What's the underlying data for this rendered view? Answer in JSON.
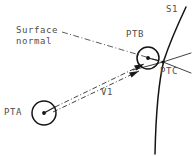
{
  "diagram": {
    "type": "technical-line-diagram",
    "canvas": {
      "width": 192,
      "height": 157,
      "background": "#ffffff"
    },
    "colors": {
      "line": "#1a1a1a",
      "curve": "#141414",
      "dashdot": "#3a3a3a",
      "text": "#4d4d4d",
      "background": "#ffffff"
    },
    "labels": {
      "surface_normal": "Surface\nnormal",
      "pta": "PTA",
      "ptb": "PTB",
      "ptc": "PTC",
      "s1": "S1",
      "v1": "V1"
    },
    "points": [
      {
        "id": "PTA",
        "label": "PTA",
        "x": 44,
        "y": 113,
        "marker": "circle-with-center-dot",
        "radius": 12
      },
      {
        "id": "PTB",
        "label": "PTB",
        "x": 148,
        "y": 58,
        "marker": "circle-with-center-dot",
        "radius": 11
      },
      {
        "id": "PTC",
        "label": "PTC",
        "x": 163,
        "y": 62,
        "marker": "intersection",
        "radius": 0
      }
    ],
    "curves": [
      {
        "id": "S1",
        "label": "S1",
        "style": "solid",
        "description": "surface profile curve passing through PTC"
      }
    ],
    "vectors": [
      {
        "id": "V1",
        "label": "V1",
        "from": "PTA",
        "to": "PTB",
        "style": "dash-dot",
        "arrowheads": 2,
        "description": "incident direction vector drawn as a double parallel dash-dot arrow"
      },
      {
        "id": "N1",
        "label": "Surface normal",
        "to": "PTC",
        "style": "dash-dot",
        "description": "leader line from the Surface normal caption to point PTC"
      }
    ],
    "tangent_lines": [
      {
        "id": "T1",
        "through": "PTC",
        "style": "solid-thin",
        "description": "shallow line up-right of PTC"
      },
      {
        "id": "T2",
        "through": "PTC",
        "style": "solid-thin",
        "description": "line down-right of PTC"
      }
    ]
  }
}
